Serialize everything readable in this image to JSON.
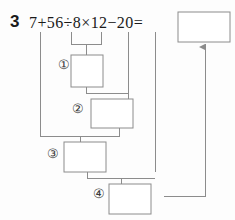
{
  "problem": {
    "number": "3",
    "expression": "7+56÷8×12−20=",
    "operands": [
      "7",
      "56",
      "8",
      "12",
      "20"
    ],
    "operators": [
      "+",
      "÷",
      "×",
      "−",
      "="
    ]
  },
  "answer_box": {
    "value": "",
    "placeholder": ""
  },
  "steps": [
    {
      "label": "①",
      "value": "",
      "placeholder": ""
    },
    {
      "label": "②",
      "value": "",
      "placeholder": ""
    },
    {
      "label": "③",
      "value": "",
      "placeholder": ""
    },
    {
      "label": "④",
      "value": "",
      "placeholder": ""
    }
  ],
  "colors": {
    "ink": "#1a1a1a",
    "line": "#8c8c8c",
    "box_border": "#8c8c8c",
    "background": "#fdfdfd"
  }
}
